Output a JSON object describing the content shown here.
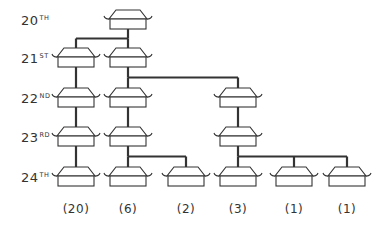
{
  "diagram": {
    "type": "family-tree",
    "generations": [
      {
        "num": "20",
        "suffix": "TH",
        "y": 20
      },
      {
        "num": "21",
        "suffix": "ST",
        "y": 58
      },
      {
        "num": "22",
        "suffix": "ND",
        "y": 98
      },
      {
        "num": "23",
        "suffix": "RD",
        "y": 137
      },
      {
        "num": "24",
        "suffix": "TH",
        "y": 177
      }
    ],
    "columns": [
      76,
      128,
      186,
      238,
      294,
      347
    ],
    "nodes": [
      {
        "id": "g20",
        "col": 1,
        "gen": 0
      },
      {
        "id": "a21",
        "col": 0,
        "gen": 1
      },
      {
        "id": "b21",
        "col": 1,
        "gen": 1
      },
      {
        "id": "a22",
        "col": 0,
        "gen": 2
      },
      {
        "id": "b22",
        "col": 1,
        "gen": 2
      },
      {
        "id": "c22",
        "col": 3,
        "gen": 2
      },
      {
        "id": "a23",
        "col": 0,
        "gen": 3
      },
      {
        "id": "b23",
        "col": 1,
        "gen": 3
      },
      {
        "id": "c23",
        "col": 3,
        "gen": 3
      },
      {
        "id": "a24",
        "col": 0,
        "gen": 4
      },
      {
        "id": "b24",
        "col": 1,
        "gen": 4
      },
      {
        "id": "d24",
        "col": 2,
        "gen": 4
      },
      {
        "id": "c24",
        "col": 3,
        "gen": 4
      },
      {
        "id": "e24",
        "col": 4,
        "gen": 4
      },
      {
        "id": "f24",
        "col": 5,
        "gen": 4
      }
    ],
    "edges": [
      [
        "g20",
        "a21"
      ],
      [
        "g20",
        "b21"
      ],
      [
        "a21",
        "a22"
      ],
      [
        "b21",
        "b22"
      ],
      [
        "b21",
        "c22"
      ],
      [
        "a22",
        "a23"
      ],
      [
        "b22",
        "b23"
      ],
      [
        "c22",
        "c23"
      ],
      [
        "a23",
        "a24"
      ],
      [
        "b23",
        "b24"
      ],
      [
        "b23",
        "d24"
      ],
      [
        "c23",
        "c24"
      ],
      [
        "c23",
        "e24"
      ],
      [
        "c23",
        "f24"
      ]
    ],
    "counts": [
      "(20)",
      "(6)",
      "(2)",
      "(3)",
      "(1)",
      "(1)"
    ],
    "line_color": "#333333"
  }
}
